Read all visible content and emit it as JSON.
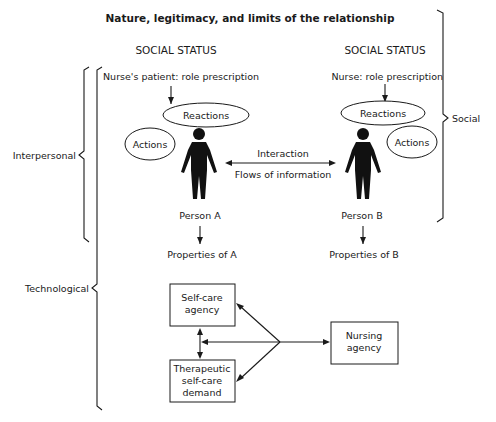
{
  "diagram": {
    "title": "Nature, legitimacy, and limits of the relationship",
    "left_column": {
      "status": "SOCIAL STATUS",
      "role": "Nurse's patient: role prescription",
      "reactions": "Reactions",
      "actions": "Actions",
      "person": "Person A",
      "properties": "Properties of A"
    },
    "right_column": {
      "status": "SOCIAL STATUS",
      "role": "Nurse: role prescription",
      "reactions": "Reactions",
      "actions": "Actions",
      "person": "Person B",
      "properties": "Properties of B"
    },
    "interaction": {
      "top": "Interaction",
      "bottom": "Flows of information"
    },
    "braces": {
      "social": "Social",
      "interpersonal": "Interpersonal",
      "technological": "Technological"
    },
    "boxes": {
      "self_care_agency": [
        "Self-care",
        "agency"
      ],
      "therapeutic_demand": [
        "Therapeutic",
        "self-care",
        "demand"
      ],
      "nursing_agency": [
        "Nursing",
        "agency"
      ]
    }
  }
}
